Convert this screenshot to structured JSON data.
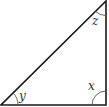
{
  "diagram": {
    "type": "right-triangle",
    "stroke_color": "#1a1a1a",
    "arc_color": "#555555",
    "vertices": {
      "bottom_left": [
        1,
        105
      ],
      "bottom_right": [
        106,
        105
      ],
      "top_right": [
        106,
        1
      ]
    },
    "angles": [
      {
        "id": "y",
        "label": "y",
        "vertex": "bottom_left"
      },
      {
        "id": "x",
        "label": "x",
        "vertex": "bottom_right"
      },
      {
        "id": "z",
        "label": "z",
        "vertex": "top_right"
      }
    ]
  }
}
